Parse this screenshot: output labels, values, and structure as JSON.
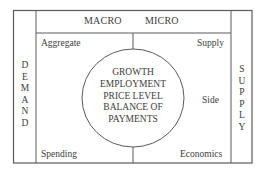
{
  "diagram": {
    "header": {
      "left_label": "MACRO",
      "right_label": "MICRO"
    },
    "corners": {
      "top_left": "Aggregate",
      "top_right": "Supply",
      "middle_right": "Side",
      "bottom_left": "Spending",
      "bottom_right": "Economics"
    },
    "left_column": {
      "word": "DEMAND",
      "letters": [
        "D",
        "E",
        "M",
        "A",
        "N",
        "D"
      ]
    },
    "right_column": {
      "word": "SUPPLY",
      "letters": [
        "S",
        "U",
        "P",
        "P",
        "L",
        "Y"
      ]
    },
    "circle": {
      "lines": [
        "GROWTH",
        "EMPLOYMENT",
        "PRICE LEVEL",
        "BALANCE OF",
        "PAYMENTS"
      ]
    },
    "colors": {
      "line": "#5a5a5a",
      "text": "#3c3c3c",
      "background": "#ffffff"
    }
  }
}
